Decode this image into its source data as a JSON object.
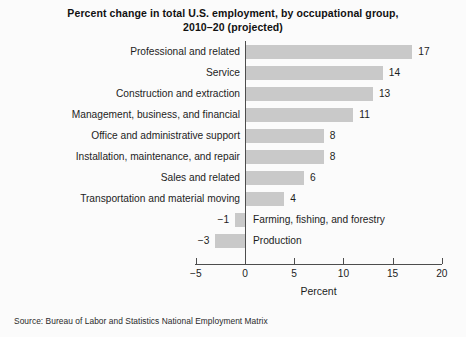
{
  "chart_data": {
    "type": "bar",
    "orientation": "horizontal",
    "title": "Percent change in total U.S. employment, by occupational group, 2010–20 (projected)",
    "title_line1": "Percent change in total U.S. employment, by occupational group,",
    "title_line2": "2010–20 (projected)",
    "xlabel": "Percent",
    "ylabel": "",
    "xlim": [
      -5,
      20
    ],
    "xticks": [
      -5,
      0,
      5,
      10,
      15,
      20
    ],
    "xtick_labels": [
      "−5",
      "0",
      "5",
      "10",
      "15",
      "20"
    ],
    "grid": false,
    "legend": null,
    "bar_color": "#c9c9c9",
    "axis_color": "#4d4d4d",
    "source": "Source: Bureau of Labor and Statistics National Employment Matrix",
    "categories": [
      "Professional and related",
      "Service",
      "Construction and extraction",
      "Management, business, and financial",
      "Office and administrative support",
      "Installation, maintenance, and repair",
      "Sales and related",
      "Transportation and material moving",
      "Farming, fishing, and forestry",
      "Production"
    ],
    "values": [
      17,
      14,
      13,
      11,
      8,
      8,
      6,
      4,
      -1,
      -3
    ],
    "value_labels": [
      "17",
      "14",
      "13",
      "11",
      "8",
      "8",
      "6",
      "4",
      "−1",
      "−3"
    ],
    "bars": [
      {
        "category": "Professional and related",
        "value": 17,
        "label": "17"
      },
      {
        "category": "Service",
        "value": 14,
        "label": "14"
      },
      {
        "category": "Construction and extraction",
        "value": 13,
        "label": "13"
      },
      {
        "category": "Management, business, and financial",
        "value": 11,
        "label": "11"
      },
      {
        "category": "Office and administrative support",
        "value": 8,
        "label": "8"
      },
      {
        "category": "Installation, maintenance, and repair",
        "value": 8,
        "label": "8"
      },
      {
        "category": "Sales and related",
        "value": 6,
        "label": "6"
      },
      {
        "category": "Transportation and material moving",
        "value": 4,
        "label": "4"
      },
      {
        "category": "Farming, fishing, and forestry",
        "value": -1,
        "label": "−1"
      },
      {
        "category": "Production",
        "value": -3,
        "label": "−3"
      }
    ]
  }
}
